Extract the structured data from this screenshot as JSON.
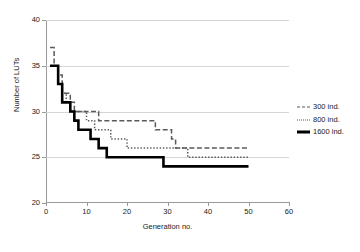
{
  "chart_data": {
    "type": "line",
    "title": "",
    "subtitle": "",
    "xlabel": "Generation no.",
    "ylabel": "Number of LUTs",
    "xlim": [
      0,
      60
    ],
    "ylim": [
      20,
      40
    ],
    "xticks": [
      "0",
      "10",
      "20",
      "30",
      "40",
      "50",
      "60"
    ],
    "yticks": [
      "20",
      "25",
      "30",
      "35",
      "40"
    ],
    "grid": "horizontal",
    "legend_position": "right",
    "series": [
      {
        "name": "300 ind.",
        "style": "dashed",
        "color": "#5a5a5a",
        "x": [
          1,
          2,
          3,
          4,
          5,
          6,
          7,
          8,
          9,
          10,
          11,
          12,
          13,
          14,
          15,
          16,
          17,
          18,
          19,
          20,
          21,
          22,
          23,
          24,
          25,
          26,
          27,
          28,
          29,
          30,
          31,
          32,
          33,
          34,
          35,
          36,
          37,
          38,
          39,
          40,
          41,
          42,
          43,
          44,
          45,
          46,
          47,
          48,
          49,
          50
        ],
        "values": [
          37,
          35,
          34,
          32,
          32,
          31,
          30,
          30,
          30,
          30,
          30,
          30,
          29,
          29,
          29,
          29,
          29,
          29,
          29,
          29,
          29,
          29,
          29,
          29,
          29,
          29,
          28,
          28,
          28,
          28,
          27,
          26,
          26,
          26,
          26,
          26,
          26,
          26,
          26,
          26,
          26,
          26,
          26,
          26,
          26,
          26,
          26,
          26,
          26,
          26
        ]
      },
      {
        "name": "800 ind.",
        "style": "dotted",
        "color": "#5a5a5a",
        "x": [
          1,
          2,
          3,
          4,
          5,
          6,
          7,
          8,
          9,
          10,
          11,
          12,
          13,
          14,
          15,
          16,
          17,
          18,
          19,
          20,
          21,
          22,
          23,
          24,
          25,
          26,
          27,
          28,
          29,
          30,
          31,
          32,
          33,
          34,
          35,
          36,
          37,
          38,
          39,
          40,
          41,
          42,
          43,
          44,
          45,
          46,
          47,
          48,
          49,
          50
        ],
        "values": [
          35,
          35,
          33,
          32,
          31,
          30,
          30,
          30,
          30,
          29,
          29,
          28,
          28,
          28,
          28,
          27,
          27,
          27,
          27,
          26,
          26,
          26,
          26,
          26,
          26,
          26,
          26,
          26,
          26,
          26,
          26,
          26,
          26,
          26,
          25,
          25,
          25,
          25,
          25,
          25,
          25,
          25,
          25,
          25,
          25,
          25,
          25,
          25,
          25,
          25
        ]
      },
      {
        "name": "1600 ind.",
        "style": "solid",
        "color": "#000000",
        "x": [
          1,
          2,
          3,
          4,
          5,
          6,
          7,
          8,
          9,
          10,
          11,
          12,
          13,
          14,
          15,
          16,
          17,
          18,
          19,
          20,
          21,
          22,
          23,
          24,
          25,
          26,
          27,
          28,
          29,
          30,
          31,
          32,
          33,
          34,
          35,
          36,
          37,
          38,
          39,
          40,
          41,
          42,
          43,
          44,
          45,
          46,
          47,
          48,
          49,
          50
        ],
        "values": [
          35,
          35,
          33,
          31,
          31,
          30,
          29,
          28,
          28,
          28,
          27,
          27,
          26,
          26,
          25,
          25,
          25,
          25,
          25,
          25,
          25,
          25,
          25,
          25,
          25,
          25,
          25,
          25,
          24,
          24,
          24,
          24,
          24,
          24,
          24,
          24,
          24,
          24,
          24,
          24,
          24,
          24,
          24,
          24,
          24,
          24,
          24,
          24,
          24,
          24
        ]
      }
    ]
  }
}
